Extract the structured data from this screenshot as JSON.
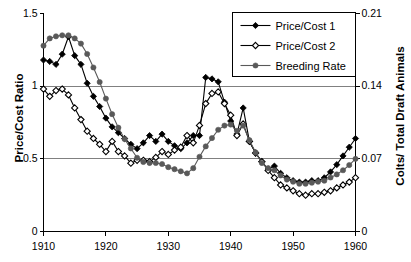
{
  "chart_data": {
    "type": "line",
    "title": "",
    "xlabel": "",
    "ylabel": "Price/Cost Ratio",
    "y2label": "Colts/ Total Draft Animals",
    "xlim": [
      1910,
      1960
    ],
    "ylim": [
      0,
      1.5
    ],
    "y2lim": [
      0,
      0.21
    ],
    "xticks": [
      "1910",
      "1920",
      "1930",
      "1940",
      "1950",
      "1960"
    ],
    "xtick_values": [
      1910,
      1920,
      1930,
      1940,
      1950,
      1960
    ],
    "yticks": [
      "0",
      "0.5",
      "1",
      "1.5"
    ],
    "ytick_values": [
      0,
      0.5,
      1,
      1.5
    ],
    "y2ticks": [
      "0",
      "0.07",
      "0.14",
      "0.21"
    ],
    "y2tick_values": [
      0,
      0.07,
      0.14,
      0.21
    ],
    "grid": true,
    "gridlines_y": [
      0.5,
      1.0
    ],
    "legend_position": "top-right",
    "x": [
      1910,
      1911,
      1912,
      1913,
      1914,
      1915,
      1916,
      1917,
      1918,
      1919,
      1920,
      1921,
      1922,
      1923,
      1924,
      1925,
      1926,
      1927,
      1928,
      1929,
      1930,
      1931,
      1932,
      1933,
      1934,
      1935,
      1936,
      1937,
      1938,
      1939,
      1940,
      1941,
      1942,
      1943,
      1944,
      1945,
      1946,
      1947,
      1948,
      1949,
      1950,
      1951,
      1952,
      1953,
      1954,
      1955,
      1956,
      1957,
      1958,
      1959,
      1960
    ],
    "series": [
      {
        "name": "Price/Cost 1",
        "marker": "filled-diamond",
        "axis": "left",
        "color": "#000000",
        "values": [
          1.18,
          1.17,
          1.15,
          1.22,
          1.34,
          1.21,
          1.15,
          1.02,
          0.93,
          0.86,
          0.78,
          0.72,
          0.68,
          0.64,
          0.6,
          0.57,
          0.61,
          0.66,
          0.62,
          0.67,
          0.62,
          0.59,
          0.57,
          0.61,
          0.66,
          0.66,
          1.06,
          1.05,
          1.03,
          0.89,
          0.76,
          0.67,
          0.85,
          0.62,
          0.54,
          0.48,
          0.43,
          0.45,
          0.4,
          0.37,
          0.35,
          0.34,
          0.34,
          0.35,
          0.35,
          0.37,
          0.41,
          0.46,
          0.52,
          0.58,
          0.64
        ]
      },
      {
        "name": "Price/Cost 2",
        "marker": "open-diamond",
        "axis": "left",
        "color": "#000000",
        "values": [
          0.98,
          0.93,
          0.97,
          0.98,
          0.94,
          0.85,
          0.77,
          0.69,
          0.64,
          0.6,
          0.55,
          0.62,
          0.55,
          0.52,
          0.47,
          0.49,
          0.49,
          0.48,
          0.51,
          0.55,
          0.53,
          0.56,
          0.58,
          0.66,
          0.61,
          0.73,
          0.88,
          0.95,
          0.96,
          0.88,
          0.8,
          0.66,
          0.74,
          0.62,
          0.54,
          0.48,
          0.42,
          0.37,
          0.32,
          0.3,
          0.28,
          0.26,
          0.25,
          0.26,
          0.26,
          0.27,
          0.28,
          0.3,
          0.32,
          0.34,
          0.37
        ]
      },
      {
        "name": "Breeding Rate",
        "marker": "filled-circle",
        "axis": "right",
        "color": "#595959",
        "values": [
          0.179,
          0.186,
          0.188,
          0.189,
          0.189,
          0.186,
          0.181,
          0.171,
          0.158,
          0.144,
          0.128,
          0.113,
          0.1,
          0.089,
          0.08,
          0.071,
          0.067,
          0.066,
          0.066,
          0.065,
          0.062,
          0.06,
          0.058,
          0.056,
          0.061,
          0.072,
          0.082,
          0.09,
          0.098,
          0.102,
          0.103,
          0.097,
          0.102,
          0.088,
          0.076,
          0.066,
          0.061,
          0.059,
          0.054,
          0.05,
          0.048,
          0.046,
          0.046,
          0.047,
          0.048,
          0.049,
          0.052,
          0.055,
          0.059,
          0.064,
          0.07
        ]
      }
    ]
  },
  "legend": {
    "items": [
      {
        "label": "Price/Cost 1",
        "marker": "filled-diamond"
      },
      {
        "label": "Price/Cost 2",
        "marker": "open-diamond"
      },
      {
        "label": "Breeding Rate",
        "marker": "filled-circle"
      }
    ]
  },
  "colors": {
    "axis": "#000000",
    "grid": "#808080",
    "series1": "#000000",
    "series2": "#000000",
    "series3": "#595959",
    "background": "#ffffff"
  }
}
